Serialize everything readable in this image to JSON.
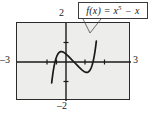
{
  "figure": {
    "background_color": "#ffffff",
    "plot_background_color": "#ededec",
    "frame_color": "#2b2b2b",
    "curve_color": "#1a1a1a"
  },
  "callout": {
    "name": "function-label",
    "text_plain": "f(x) = x^5 - x",
    "f_part": "f",
    "arg_part": "(x) = ",
    "base_part": "x",
    "exponent_part": "5",
    "minus_part": " − ",
    "tail_part": "x",
    "border_color": "#3a3a3a",
    "fill_color": "#ffffff"
  },
  "axes": {
    "x_min_label": "–3",
    "x_max_label": "3",
    "y_max_label": "2",
    "y_min_label": "–2"
  },
  "chart_data": {
    "type": "line",
    "title": "",
    "subtitle": "",
    "xlabel": "",
    "ylabel": "",
    "xlim": [
      -3,
      3
    ],
    "ylim": [
      -2,
      2
    ],
    "grid": false,
    "legend_position": "none",
    "x_ticks": [
      -2,
      -1,
      1,
      2
    ],
    "y_ticks": [
      -1,
      1
    ],
    "tick_labels_shown": [
      "–3",
      "3",
      "2",
      "–2"
    ],
    "annotations": [
      {
        "text": "f(x) = x⁵ − x",
        "kind": "boxed-callout-with-leader",
        "points_to_x": 1.15,
        "points_to_y": 1.55
      }
    ],
    "series": [
      {
        "name": "f(x) = x^5 - x",
        "color": "#1a1a1a",
        "x": [
          -1.175,
          -1.15,
          -1.1,
          -1.05,
          -1.0,
          -0.95,
          -0.9,
          -0.85,
          -0.8,
          -0.75,
          -0.7,
          -0.65,
          -0.6,
          -0.55,
          -0.5,
          -0.45,
          -0.4,
          -0.35,
          -0.3,
          -0.25,
          -0.2,
          -0.15,
          -0.1,
          -0.05,
          0.0,
          0.05,
          0.1,
          0.15,
          0.2,
          0.25,
          0.3,
          0.35,
          0.4,
          0.45,
          0.5,
          0.55,
          0.6,
          0.65,
          0.7,
          0.75,
          0.8,
          0.85,
          0.9,
          0.95,
          1.0,
          1.05,
          1.1,
          1.15,
          1.175
        ],
        "y": [
          -1.066,
          -0.862,
          -0.511,
          -0.226,
          0.0,
          0.176,
          0.31,
          0.407,
          0.472,
          0.513,
          0.532,
          0.534,
          0.522,
          0.5,
          0.469,
          0.432,
          0.39,
          0.345,
          0.298,
          0.249,
          0.2,
          0.15,
          0.1,
          0.05,
          0.0,
          -0.05,
          -0.1,
          -0.15,
          -0.2,
          -0.249,
          -0.298,
          -0.345,
          -0.39,
          -0.432,
          -0.469,
          -0.5,
          -0.522,
          -0.534,
          -0.532,
          -0.513,
          -0.472,
          -0.407,
          -0.31,
          -0.176,
          0.0,
          0.226,
          0.511,
          0.862,
          1.066
        ]
      }
    ]
  }
}
